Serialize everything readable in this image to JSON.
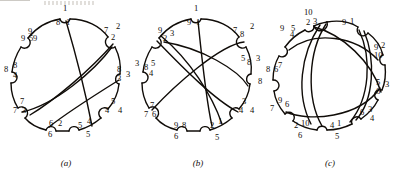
{
  "figure": {
    "type": "chord-diagram-set",
    "panel_count": 3,
    "ink_color": "#100c08",
    "background_color": "#ffffff"
  },
  "panels": [
    {
      "id": "a",
      "caption": "(a)",
      "vertex_count": 9,
      "outer_labels": [
        "1",
        "2",
        "3",
        "4",
        "5",
        "6",
        "7",
        "8",
        "9"
      ],
      "arc_labels": [
        {
          "left": "8",
          "right": "1"
        },
        {
          "left": "7",
          "right": "2"
        },
        {
          "left": "8",
          "right": "3"
        },
        {
          "left": "5",
          "right": "4"
        },
        {
          "left": "5",
          "right": "4"
        },
        {
          "left": "6",
          "right": "2"
        },
        {
          "left": "7",
          "right": "3"
        },
        {
          "left": "8",
          "right": "4"
        },
        {
          "left": "9",
          "right": "5"
        }
      ],
      "chords": [
        {
          "from": 1,
          "to": 5
        },
        {
          "from": 2,
          "to": 6
        },
        {
          "from": 3,
          "to": 7
        },
        {
          "from": 1,
          "to": 4
        }
      ]
    },
    {
      "id": "b",
      "caption": "(b)",
      "vertex_count": 9,
      "outer_labels": [
        "1",
        "2",
        "3",
        "4",
        "5",
        "6",
        "7",
        "8",
        "9"
      ],
      "arc_labels": [
        {
          "left": "9",
          "right": "1"
        },
        {
          "left": "7",
          "right": "8"
        },
        {
          "left": "5",
          "right": "8"
        },
        {
          "left": "3",
          "right": "4"
        },
        {
          "left": "2",
          "right": "1"
        },
        {
          "left": "9",
          "right": "8"
        },
        {
          "left": "7",
          "right": "6"
        },
        {
          "left": "8",
          "right": "5",
          "sub": "4"
        },
        {
          "left": "9",
          "right": "2",
          "sub": "3"
        }
      ],
      "extra_labels": [
        "3",
        "8",
        "6",
        "5"
      ],
      "chords": [
        {
          "from": 1,
          "to": 5
        },
        {
          "from": 2,
          "to": 6
        },
        {
          "from": 3,
          "to": 9
        },
        {
          "from": 4,
          "to": 8
        }
      ]
    },
    {
      "id": "c",
      "caption": "(c)",
      "vertex_count": 10,
      "outer_labels": [
        "1",
        "2",
        "3",
        "4",
        "5",
        "6",
        "7",
        "8",
        "9",
        "10"
      ],
      "arc_labels": [
        {
          "left": "2",
          "right": "3",
          "top": "10"
        },
        {
          "left": "9",
          "right": "1"
        },
        {
          "left": "9",
          "right": "2",
          "sub": "10"
        },
        {
          "left": "5",
          "right": "3",
          "sub": "6"
        },
        {
          "left": "6",
          "right": "3",
          "sub": "4"
        },
        {
          "left": "4",
          "right": "1",
          "sub": "5"
        },
        {
          "left": "2",
          "right": "10",
          "sub": "6"
        },
        {
          "left": "9",
          "right": "6",
          "pre": "7"
        },
        {
          "left": "7",
          "right": "6",
          "pre": "8"
        },
        {
          "left": "5",
          "right": "4",
          "pre": "9"
        }
      ],
      "chords": [
        {
          "from": 1,
          "to": 6
        },
        {
          "from": 2,
          "to": 7
        },
        {
          "from": 3,
          "to": 8
        },
        {
          "from": 4,
          "to": 9
        },
        {
          "from": 5,
          "to": 10
        }
      ]
    }
  ]
}
